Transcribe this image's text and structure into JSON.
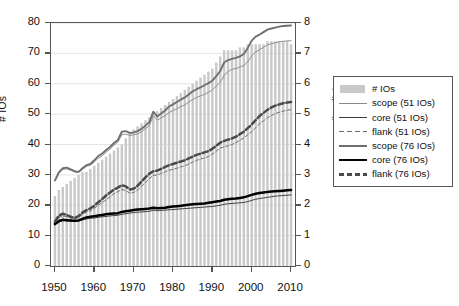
{
  "chart_data": {
    "type": "bar",
    "title": "",
    "xlabel": "",
    "ylabel": "# IOs",
    "ylabel_right": "# policies",
    "xlim": [
      1949,
      2011
    ],
    "ylim": [
      0,
      80
    ],
    "ylim_right": [
      0,
      8
    ],
    "grid": true,
    "legend_position": "right-outside",
    "x_ticks": [
      1950,
      1960,
      1970,
      1980,
      1990,
      2000,
      2010
    ],
    "y_ticks_left": [
      0,
      10,
      20,
      30,
      40,
      50,
      60,
      70,
      80
    ],
    "y_ticks_right": [
      0,
      1,
      2,
      3,
      4,
      5,
      6,
      7,
      8
    ],
    "x": [
      1950,
      1951,
      1952,
      1953,
      1954,
      1955,
      1956,
      1957,
      1958,
      1959,
      1960,
      1961,
      1962,
      1963,
      1964,
      1965,
      1966,
      1967,
      1968,
      1969,
      1970,
      1971,
      1972,
      1973,
      1974,
      1975,
      1976,
      1977,
      1978,
      1979,
      1980,
      1981,
      1982,
      1983,
      1984,
      1985,
      1986,
      1987,
      1988,
      1989,
      1990,
      1991,
      1992,
      1993,
      1994,
      1995,
      1996,
      1997,
      1998,
      1999,
      2000,
      2001,
      2002,
      2003,
      2004,
      2005,
      2006,
      2007,
      2008,
      2009,
      2010
    ],
    "bars": {
      "name": "# IOs",
      "axis": "left",
      "color": "#c9c9c9",
      "values": [
        23,
        25,
        26,
        27,
        28,
        29,
        30,
        31,
        31,
        32,
        33,
        34,
        35,
        36,
        37,
        38,
        39,
        40,
        42,
        44,
        45,
        46,
        47,
        48,
        49,
        50,
        51,
        52,
        53,
        54,
        55,
        56,
        57,
        58,
        59,
        60,
        61,
        62,
        63,
        64,
        65,
        67,
        69,
        71,
        71,
        71,
        71,
        72,
        72,
        73,
        73,
        73,
        73,
        73,
        74,
        74,
        74,
        74,
        74,
        74,
        73
      ]
    },
    "series": [
      {
        "name": "scope (51 IOs)",
        "axis": "right",
        "style": "solid",
        "width": "thin",
        "color": "#8a8a8a",
        "values": [
          2.8,
          3.05,
          3.18,
          3.2,
          3.15,
          3.1,
          3.08,
          3.18,
          3.28,
          3.32,
          3.42,
          3.55,
          3.62,
          3.75,
          3.85,
          3.98,
          4.08,
          4.32,
          4.34,
          4.3,
          4.32,
          4.35,
          4.42,
          4.52,
          4.62,
          4.95,
          4.8,
          4.88,
          4.95,
          5.05,
          5.12,
          5.18,
          5.25,
          5.3,
          5.4,
          5.48,
          5.55,
          5.6,
          5.65,
          5.72,
          5.8,
          5.92,
          6.05,
          6.28,
          6.4,
          6.48,
          6.5,
          6.55,
          6.6,
          6.72,
          6.92,
          7.05,
          7.12,
          7.2,
          7.28,
          7.32,
          7.35,
          7.38,
          7.4,
          7.41,
          7.42
        ]
      },
      {
        "name": "core (51 IOs)",
        "axis": "right",
        "style": "solid",
        "width": "thin",
        "color": "#3a3a3a",
        "values": [
          1.36,
          1.44,
          1.5,
          1.49,
          1.48,
          1.47,
          1.48,
          1.52,
          1.55,
          1.57,
          1.58,
          1.6,
          1.62,
          1.63,
          1.65,
          1.66,
          1.67,
          1.7,
          1.72,
          1.74,
          1.76,
          1.77,
          1.78,
          1.79,
          1.8,
          1.84,
          1.82,
          1.83,
          1.84,
          1.85,
          1.86,
          1.87,
          1.88,
          1.89,
          1.9,
          1.91,
          1.92,
          1.93,
          1.94,
          1.95,
          1.96,
          1.98,
          2.0,
          2.03,
          2.05,
          2.06,
          2.07,
          2.08,
          2.09,
          2.12,
          2.16,
          2.2,
          2.22,
          2.24,
          2.26,
          2.28,
          2.3,
          2.31,
          2.32,
          2.33,
          2.34
        ]
      },
      {
        "name": "flank (51 IOs)",
        "axis": "right",
        "style": "dashed",
        "width": "thin",
        "color": "#6a6a6a",
        "values": [
          1.44,
          1.6,
          1.65,
          1.62,
          1.58,
          1.55,
          1.6,
          1.7,
          1.78,
          1.82,
          1.9,
          2.0,
          2.08,
          2.18,
          2.28,
          2.38,
          2.45,
          2.52,
          2.48,
          2.4,
          2.42,
          2.5,
          2.62,
          2.75,
          2.88,
          2.98,
          3.0,
          3.05,
          3.1,
          3.15,
          3.18,
          3.22,
          3.26,
          3.3,
          3.36,
          3.42,
          3.48,
          3.52,
          3.56,
          3.6,
          3.68,
          3.78,
          3.88,
          3.92,
          3.96,
          4.0,
          4.06,
          4.14,
          4.22,
          4.32,
          4.42,
          4.55,
          4.68,
          4.78,
          4.88,
          4.95,
          5.02,
          5.06,
          5.1,
          5.13,
          5.15
        ]
      },
      {
        "name": "scope (76 IOs)",
        "axis": "right",
        "style": "solid",
        "width": "medium",
        "color": "#707070",
        "values": [
          2.82,
          3.08,
          3.22,
          3.24,
          3.18,
          3.12,
          3.1,
          3.22,
          3.32,
          3.36,
          3.48,
          3.62,
          3.7,
          3.82,
          3.92,
          4.05,
          4.15,
          4.42,
          4.44,
          4.38,
          4.4,
          4.44,
          4.52,
          4.62,
          4.74,
          5.08,
          4.92,
          5.02,
          5.12,
          5.25,
          5.32,
          5.4,
          5.48,
          5.55,
          5.65,
          5.75,
          5.82,
          5.88,
          5.95,
          6.02,
          6.1,
          6.25,
          6.42,
          6.7,
          6.78,
          6.82,
          6.85,
          6.9,
          6.98,
          7.18,
          7.42,
          7.55,
          7.62,
          7.7,
          7.78,
          7.82,
          7.85,
          7.88,
          7.9,
          7.91,
          7.92
        ]
      },
      {
        "name": "core (76 IOs)",
        "axis": "right",
        "style": "solid",
        "width": "thick",
        "color": "#000000",
        "values": [
          1.38,
          1.48,
          1.52,
          1.51,
          1.5,
          1.49,
          1.5,
          1.55,
          1.6,
          1.62,
          1.64,
          1.66,
          1.68,
          1.7,
          1.72,
          1.73,
          1.74,
          1.78,
          1.8,
          1.82,
          1.84,
          1.86,
          1.87,
          1.88,
          1.89,
          1.92,
          1.9,
          1.91,
          1.92,
          1.94,
          1.96,
          1.97,
          1.98,
          2.0,
          2.02,
          2.03,
          2.04,
          2.05,
          2.06,
          2.08,
          2.1,
          2.12,
          2.14,
          2.18,
          2.2,
          2.21,
          2.22,
          2.24,
          2.26,
          2.3,
          2.34,
          2.38,
          2.4,
          2.42,
          2.44,
          2.45,
          2.46,
          2.47,
          2.48,
          2.49,
          2.5
        ]
      },
      {
        "name": "flank (76 IOs)",
        "axis": "right",
        "style": "dashed",
        "width": "thick",
        "color": "#4a4a4a",
        "values": [
          1.46,
          1.66,
          1.72,
          1.68,
          1.62,
          1.58,
          1.64,
          1.76,
          1.84,
          1.9,
          1.98,
          2.1,
          2.2,
          2.32,
          2.42,
          2.52,
          2.58,
          2.66,
          2.62,
          2.52,
          2.54,
          2.64,
          2.78,
          2.92,
          3.04,
          3.12,
          3.14,
          3.2,
          3.26,
          3.32,
          3.36,
          3.4,
          3.44,
          3.48,
          3.54,
          3.6,
          3.66,
          3.7,
          3.74,
          3.78,
          3.86,
          3.96,
          4.06,
          4.12,
          4.16,
          4.2,
          4.26,
          4.34,
          4.42,
          4.54,
          4.66,
          4.8,
          4.94,
          5.04,
          5.14,
          5.22,
          5.28,
          5.32,
          5.36,
          5.38,
          5.4
        ]
      }
    ]
  },
  "axes": {
    "left": {
      "title": "# IOs",
      "ticks": [
        "0",
        "10",
        "20",
        "30",
        "40",
        "50",
        "60",
        "70",
        "80"
      ]
    },
    "right": {
      "title": "# policies",
      "ticks": [
        "0",
        "1",
        "2",
        "3",
        "4",
        "5",
        "6",
        "7",
        "8"
      ]
    },
    "bottom": {
      "ticks": [
        "1950",
        "1960",
        "1970",
        "1980",
        "1990",
        "2000",
        "2010"
      ]
    }
  },
  "legend": {
    "items": [
      {
        "label": "# IOs",
        "key": "swatch",
        "color": "#c9c9c9",
        "style": "fill",
        "width": "bar"
      },
      {
        "label": "scope (51 IOs)",
        "key": "line",
        "color": "#8a8a8a",
        "style": "solid",
        "width": "thin"
      },
      {
        "label": "core (51 IOs)",
        "key": "line",
        "color": "#3a3a3a",
        "style": "solid",
        "width": "thin"
      },
      {
        "label": "flank (51 IOs)",
        "key": "line",
        "color": "#6a6a6a",
        "style": "dashed",
        "width": "thin"
      },
      {
        "label": "scope (76 IOs)",
        "key": "line",
        "color": "#707070",
        "style": "solid",
        "width": "medium"
      },
      {
        "label": "core (76 IOs)",
        "key": "line",
        "color": "#000000",
        "style": "solid",
        "width": "thick"
      },
      {
        "label": "flank (76 IOs)",
        "key": "line",
        "color": "#4a4a4a",
        "style": "dashed",
        "width": "thick"
      }
    ]
  }
}
